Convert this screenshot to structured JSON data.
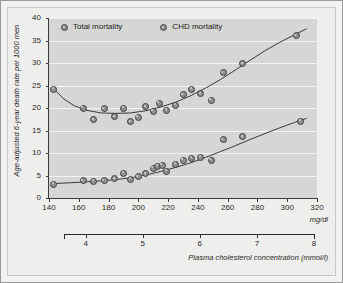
{
  "chart_data": {
    "type": "scatter",
    "title": "",
    "xlabel": "mg/dl",
    "ylabel": "Age-adjusted 6-year death rate per 1000 men",
    "secondary_xlabel": "Plasma cholesterol concentration (mmol/l)",
    "xlim": [
      140,
      320
    ],
    "ylim": [
      0,
      40
    ],
    "xticks": [
      140,
      160,
      180,
      200,
      220,
      240,
      260,
      280,
      300,
      320
    ],
    "yticks": [
      0,
      5,
      10,
      15,
      20,
      25,
      30,
      35,
      40
    ],
    "secondary_xticks": [
      4,
      5,
      6,
      7,
      8
    ],
    "grid": "horizontal",
    "legend_position": "top-left",
    "series": [
      {
        "name": "Total mortality",
        "points": [
          [
            143,
            24.2
          ],
          [
            163,
            20.0
          ],
          [
            170,
            17.4
          ],
          [
            177,
            19.9
          ],
          [
            184,
            18.1
          ],
          [
            190,
            20.0
          ],
          [
            195,
            17.0
          ],
          [
            200,
            18.0
          ],
          [
            205,
            20.3
          ],
          [
            210,
            19.3
          ],
          [
            214,
            21.1
          ],
          [
            219,
            19.5
          ],
          [
            225,
            20.6
          ],
          [
            230,
            23.0
          ],
          [
            236,
            24.2
          ],
          [
            242,
            23.2
          ],
          [
            249,
            21.7
          ],
          [
            257,
            27.8
          ],
          [
            270,
            29.9
          ],
          [
            306,
            36.1
          ]
        ]
      },
      {
        "name": "CHD mortality",
        "points": [
          [
            143,
            3.1
          ],
          [
            163,
            3.9
          ],
          [
            170,
            3.7
          ],
          [
            177,
            3.8
          ],
          [
            184,
            4.3
          ],
          [
            190,
            5.5
          ],
          [
            195,
            4.2
          ],
          [
            200,
            4.7
          ],
          [
            205,
            5.4
          ],
          [
            210,
            6.6
          ],
          [
            213,
            7.1
          ],
          [
            216,
            7.3
          ],
          [
            219,
            6.0
          ],
          [
            225,
            7.5
          ],
          [
            230,
            8.4
          ],
          [
            236,
            8.8
          ],
          [
            242,
            9.1
          ],
          [
            249,
            8.4
          ],
          [
            257,
            13.0
          ],
          [
            270,
            13.6
          ],
          [
            309,
            17.1
          ]
        ]
      }
    ],
    "fit_curves": [
      {
        "name": "Total mortality fit",
        "points": [
          [
            143,
            24.3
          ],
          [
            150,
            22.0
          ],
          [
            157,
            20.5
          ],
          [
            165,
            19.5
          ],
          [
            175,
            18.9
          ],
          [
            185,
            18.8
          ],
          [
            195,
            18.9
          ],
          [
            205,
            19.4
          ],
          [
            215,
            20.2
          ],
          [
            225,
            21.3
          ],
          [
            235,
            22.7
          ],
          [
            245,
            24.4
          ],
          [
            255,
            26.3
          ],
          [
            265,
            28.4
          ],
          [
            275,
            30.6
          ],
          [
            285,
            32.7
          ],
          [
            295,
            34.6
          ],
          [
            305,
            36.3
          ],
          [
            313,
            37.6
          ]
        ]
      },
      {
        "name": "CHD mortality fit",
        "points": [
          [
            143,
            3.2
          ],
          [
            155,
            3.4
          ],
          [
            165,
            3.6
          ],
          [
            175,
            3.8
          ],
          [
            185,
            4.1
          ],
          [
            195,
            4.5
          ],
          [
            205,
            5.1
          ],
          [
            215,
            5.9
          ],
          [
            225,
            6.8
          ],
          [
            235,
            7.8
          ],
          [
            245,
            9.0
          ],
          [
            255,
            10.3
          ],
          [
            265,
            11.6
          ],
          [
            275,
            13.0
          ],
          [
            285,
            14.3
          ],
          [
            295,
            15.6
          ],
          [
            305,
            16.8
          ],
          [
            313,
            17.7
          ]
        ]
      }
    ]
  },
  "legend": {
    "items": [
      {
        "label": "Total mortality"
      },
      {
        "label": "CHD mortality"
      }
    ]
  },
  "axes": {
    "y_title": "Age-adjusted 6-year death rate per 1000 men",
    "x_unit": "mg/dl",
    "secondary_title": "Plasma cholesterol concentration (mmol/l)"
  },
  "colors": {
    "plot_background": "#d6d6d4",
    "gridline": "#f4f4f2",
    "marker_fill": "#8f8f8f",
    "marker_edge": "#3f3f3f",
    "axis": "#3a3a3a",
    "page_background": "#eeeeec",
    "frame": "#9a9a96"
  }
}
